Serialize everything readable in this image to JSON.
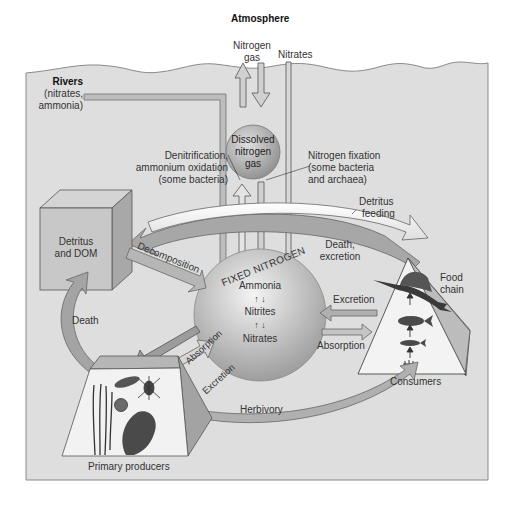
{
  "diagram": {
    "colors": {
      "water": "#dcdcdc",
      "water_edge": "#8a8a8a",
      "sphere": "#b9b9b9",
      "arrow_fill": "#c8c8c8",
      "arrow_dark": "#8f8f8f",
      "box_face": "#c6c6c6",
      "box_side": "#a0a0a0",
      "pyramid_face": "#f2f2f2",
      "pyramid_side": "#b8b8b8"
    },
    "labels": {
      "atmosphere": "Atmosphere",
      "nitrogen_gas_line1": "Nitrogen",
      "nitrogen_gas_line2": "gas",
      "nitrates_top": "Nitrates",
      "rivers_title": "Rivers",
      "rivers_line1": "(nitrates,",
      "rivers_line2": "ammonia)",
      "dissolved_line1": "Dissolved",
      "dissolved_line2": "nitrogen",
      "dissolved_line3": "gas",
      "denitrification_line1": "Denitrification,",
      "denitrification_line2": "ammonium oxidation",
      "denitrification_line3": "(some bacteria)",
      "fixation_line1": "Nitrogen fixation",
      "fixation_line2": "(some bacteria",
      "fixation_line3": "and archaea)",
      "detritus_feeding_line1": "Detritus",
      "detritus_feeding_line2": "feeding",
      "detritus_dom_line1": "Detritus",
      "detritus_dom_line2": "and DOM",
      "decomposition": "Decomposition",
      "fixed_nitrogen": "FIXED NITROGEN",
      "ammonia": "Ammonia",
      "nitrites": "Nitrites",
      "nitrates_inner": "Nitrates",
      "death_excretion_line1": "Death,",
      "death_excretion_line2": "excretion",
      "food_chain_line1": "Food",
      "food_chain_line2": "chain",
      "excretion_right": "Excretion",
      "absorption_right": "Absorption",
      "consumers": "Consumers",
      "death_left": "Death",
      "absorption_left": "Absorption",
      "excretion_left": "Excretion",
      "herbivory": "Herbivory",
      "primary_producers": "Primary producers"
    },
    "arrow_symbols": {
      "up": "↑",
      "down": "↓"
    }
  }
}
